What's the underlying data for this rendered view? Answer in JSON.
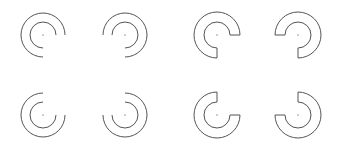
{
  "canvas": {
    "width": 343,
    "height": 148,
    "background": "#ffffff"
  },
  "style": {
    "stroke": "#555555",
    "stroke_width": 1,
    "center_dot_color": "#777777"
  },
  "shapes": [
    {
      "id": "arcs-top-left",
      "type": "double-arc",
      "cx": 43,
      "cy": 35,
      "r_outer": 22,
      "r_inner": 13,
      "sweep": "ccw-from-right-to-bottom",
      "flip_x": false,
      "flip_y": false
    },
    {
      "id": "arcs-top-right",
      "type": "double-arc",
      "cx": 125,
      "cy": 35,
      "r_outer": 22,
      "r_inner": 13,
      "flip_x": true,
      "flip_y": false
    },
    {
      "id": "sector-top-left",
      "type": "annular-sector",
      "cx": 217,
      "cy": 35,
      "r_outer": 23,
      "r_inner": 13,
      "flip_x": false,
      "flip_y": false
    },
    {
      "id": "sector-top-right",
      "type": "annular-sector",
      "cx": 298,
      "cy": 35,
      "r_outer": 23,
      "r_inner": 13,
      "flip_x": true,
      "flip_y": false
    },
    {
      "id": "arcs-bottom-left",
      "type": "double-arc",
      "cx": 43,
      "cy": 115,
      "r_outer": 22,
      "r_inner": 13,
      "flip_x": false,
      "flip_y": true
    },
    {
      "id": "arcs-bottom-right",
      "type": "double-arc",
      "cx": 125,
      "cy": 115,
      "r_outer": 22,
      "r_inner": 13,
      "flip_x": true,
      "flip_y": true
    },
    {
      "id": "sector-bottom-left",
      "type": "annular-sector",
      "cx": 217,
      "cy": 115,
      "r_outer": 23,
      "r_inner": 13,
      "flip_x": false,
      "flip_y": true
    },
    {
      "id": "sector-bottom-right",
      "type": "annular-sector",
      "cx": 298,
      "cy": 115,
      "r_outer": 23,
      "r_inner": 13,
      "flip_x": true,
      "flip_y": true
    }
  ]
}
